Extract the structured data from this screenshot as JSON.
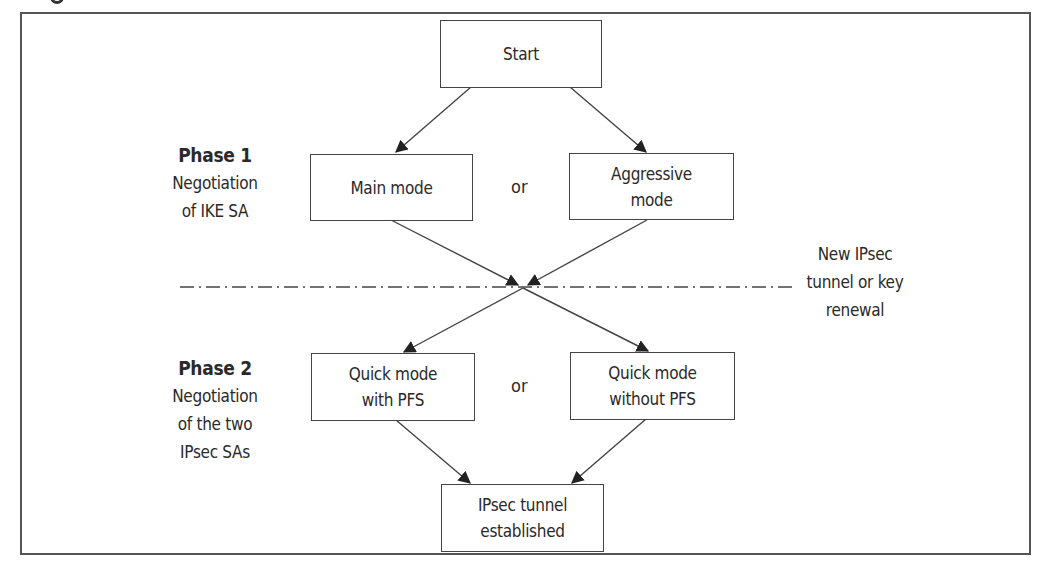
{
  "diagram": {
    "nodes": {
      "start": {
        "lines": [
          "Start"
        ]
      },
      "main_mode": {
        "lines": [
          "Main mode"
        ]
      },
      "aggressive_mode": {
        "lines": [
          "Aggressive",
          "mode"
        ]
      },
      "quick_pfs": {
        "lines": [
          "Quick mode",
          "with PFS"
        ]
      },
      "quick_no_pfs": {
        "lines": [
          "Quick mode",
          "without PFS"
        ]
      },
      "established": {
        "lines": [
          "IPsec tunnel",
          "established"
        ]
      }
    },
    "connectors": {
      "or_phase1": "or",
      "or_phase2": "or"
    },
    "phase1": {
      "title": "Phase 1",
      "desc_lines": [
        "Negotiation",
        "of IKE SA"
      ]
    },
    "phase2": {
      "title": "Phase 2",
      "desc_lines": [
        "Negotiation",
        "of the two",
        "IPsec SAs"
      ]
    },
    "divider_note": {
      "lines": [
        "New IPsec",
        "tunnel or key",
        "renewal"
      ]
    },
    "edges": [
      {
        "from": "start",
        "to": "main_mode"
      },
      {
        "from": "start",
        "to": "aggressive_mode"
      },
      {
        "from": "main_mode",
        "to": "junction"
      },
      {
        "from": "aggressive_mode",
        "to": "junction"
      },
      {
        "from": "junction",
        "to": "quick_pfs"
      },
      {
        "from": "junction",
        "to": "quick_no_pfs"
      },
      {
        "from": "quick_pfs",
        "to": "established"
      },
      {
        "from": "quick_no_pfs",
        "to": "established"
      }
    ],
    "colors": {
      "line": "#444444",
      "text": "#2a2a2a",
      "background": "#ffffff"
    }
  }
}
